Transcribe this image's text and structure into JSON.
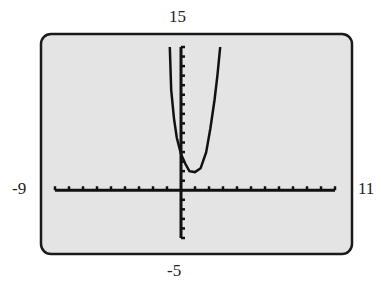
{
  "window": {
    "xmin": "-9",
    "xmax": "11",
    "ymin": "-5",
    "ymax": "15"
  },
  "colors": {
    "screen_bg": "#e4e4e4",
    "frame": "#1a1a1a",
    "ink": "#111111"
  },
  "chart_data": {
    "type": "line",
    "title": "",
    "xlabel": "",
    "ylabel": "",
    "xlim": [
      -9,
      11
    ],
    "ylim": [
      -5,
      15
    ],
    "x_tick_step": 1,
    "y_tick_step": 1,
    "grid": false,
    "series": [
      {
        "name": "f(x)",
        "x": [
          -0.8,
          -0.7,
          -0.5,
          -0.3,
          0,
          0.3,
          0.6,
          1.0,
          1.4,
          1.8,
          2.1,
          2.4,
          2.6,
          2.8
        ],
        "values": [
          15,
          10.5,
          7.5,
          5.5,
          3.8,
          2.8,
          2.0,
          1.9,
          2.3,
          4.0,
          6.5,
          9.5,
          12.0,
          15
        ]
      }
    ]
  }
}
